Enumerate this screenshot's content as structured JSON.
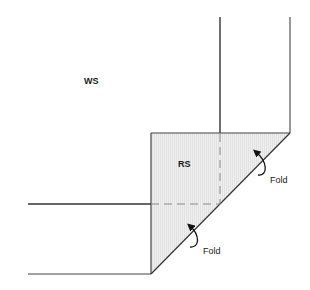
{
  "diagram": {
    "type": "sewing-fold-diagram",
    "labels": {
      "wrong_side": "WS",
      "right_side": "RS",
      "fold_upper": "Fold",
      "fold_lower": "Fold"
    },
    "colors": {
      "line": "#444444",
      "fill_rs": "#ececec",
      "dash": "#8a8a8a",
      "background": "#ffffff"
    }
  }
}
